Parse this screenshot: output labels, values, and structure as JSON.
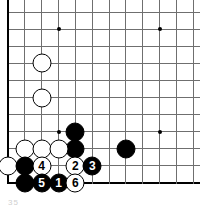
{
  "diagram": {
    "kind": "go-board-diagram",
    "caption_fragment": "35",
    "colors": {
      "line": "#6f6f6f",
      "edge": "#000000",
      "black_stone": "#000000",
      "white_stone": "#ffffff",
      "background": "#ffffff"
    },
    "geometry": {
      "origin_x": 8,
      "origin_y": 12,
      "step_x": 16.85,
      "step_y": 17.1,
      "cols": 12,
      "rows": 11,
      "edge_left_col": 0,
      "edge_bottom_row": 10
    },
    "star_points": [
      {
        "col": 3,
        "row": 1
      },
      {
        "col": 9,
        "row": 1
      },
      {
        "col": 3,
        "row": 7
      },
      {
        "col": 9,
        "row": 7
      }
    ],
    "stones": [
      {
        "id": "w-a",
        "color": "white",
        "col": 2,
        "row": 3,
        "label": ""
      },
      {
        "id": "w-b",
        "color": "white",
        "col": 2,
        "row": 5,
        "label": ""
      },
      {
        "id": "b-a",
        "color": "black",
        "col": 4,
        "row": 7,
        "label": ""
      },
      {
        "id": "b-b",
        "color": "black",
        "col": 4,
        "row": 8,
        "label": ""
      },
      {
        "id": "b-c",
        "color": "black",
        "col": 7,
        "row": 8,
        "label": ""
      },
      {
        "id": "w-c",
        "color": "white",
        "col": 1,
        "row": 8,
        "label": ""
      },
      {
        "id": "w-d",
        "color": "white",
        "col": 2,
        "row": 8,
        "label": ""
      },
      {
        "id": "w-e",
        "color": "white",
        "col": 3,
        "row": 8,
        "label": ""
      },
      {
        "id": "w-f",
        "color": "white",
        "col": 0,
        "row": 9,
        "label": ""
      },
      {
        "id": "b-d",
        "color": "black",
        "col": 1,
        "row": 9,
        "label": ""
      },
      {
        "id": "m4",
        "color": "white",
        "col": 2,
        "row": 9,
        "label": "4"
      },
      {
        "id": "m2",
        "color": "white",
        "col": 4,
        "row": 9,
        "label": "2"
      },
      {
        "id": "m3",
        "color": "black",
        "col": 5,
        "row": 9,
        "label": "3"
      },
      {
        "id": "b-e",
        "color": "black",
        "col": 1,
        "row": 10,
        "label": ""
      },
      {
        "id": "m5",
        "color": "black",
        "col": 2,
        "row": 10,
        "label": "5"
      },
      {
        "id": "m1",
        "color": "black",
        "col": 3,
        "row": 10,
        "label": "1"
      },
      {
        "id": "m6",
        "color": "white",
        "col": 4,
        "row": 10,
        "label": "6"
      }
    ],
    "move_order": [
      "1",
      "2",
      "3",
      "4",
      "5",
      "6"
    ]
  }
}
